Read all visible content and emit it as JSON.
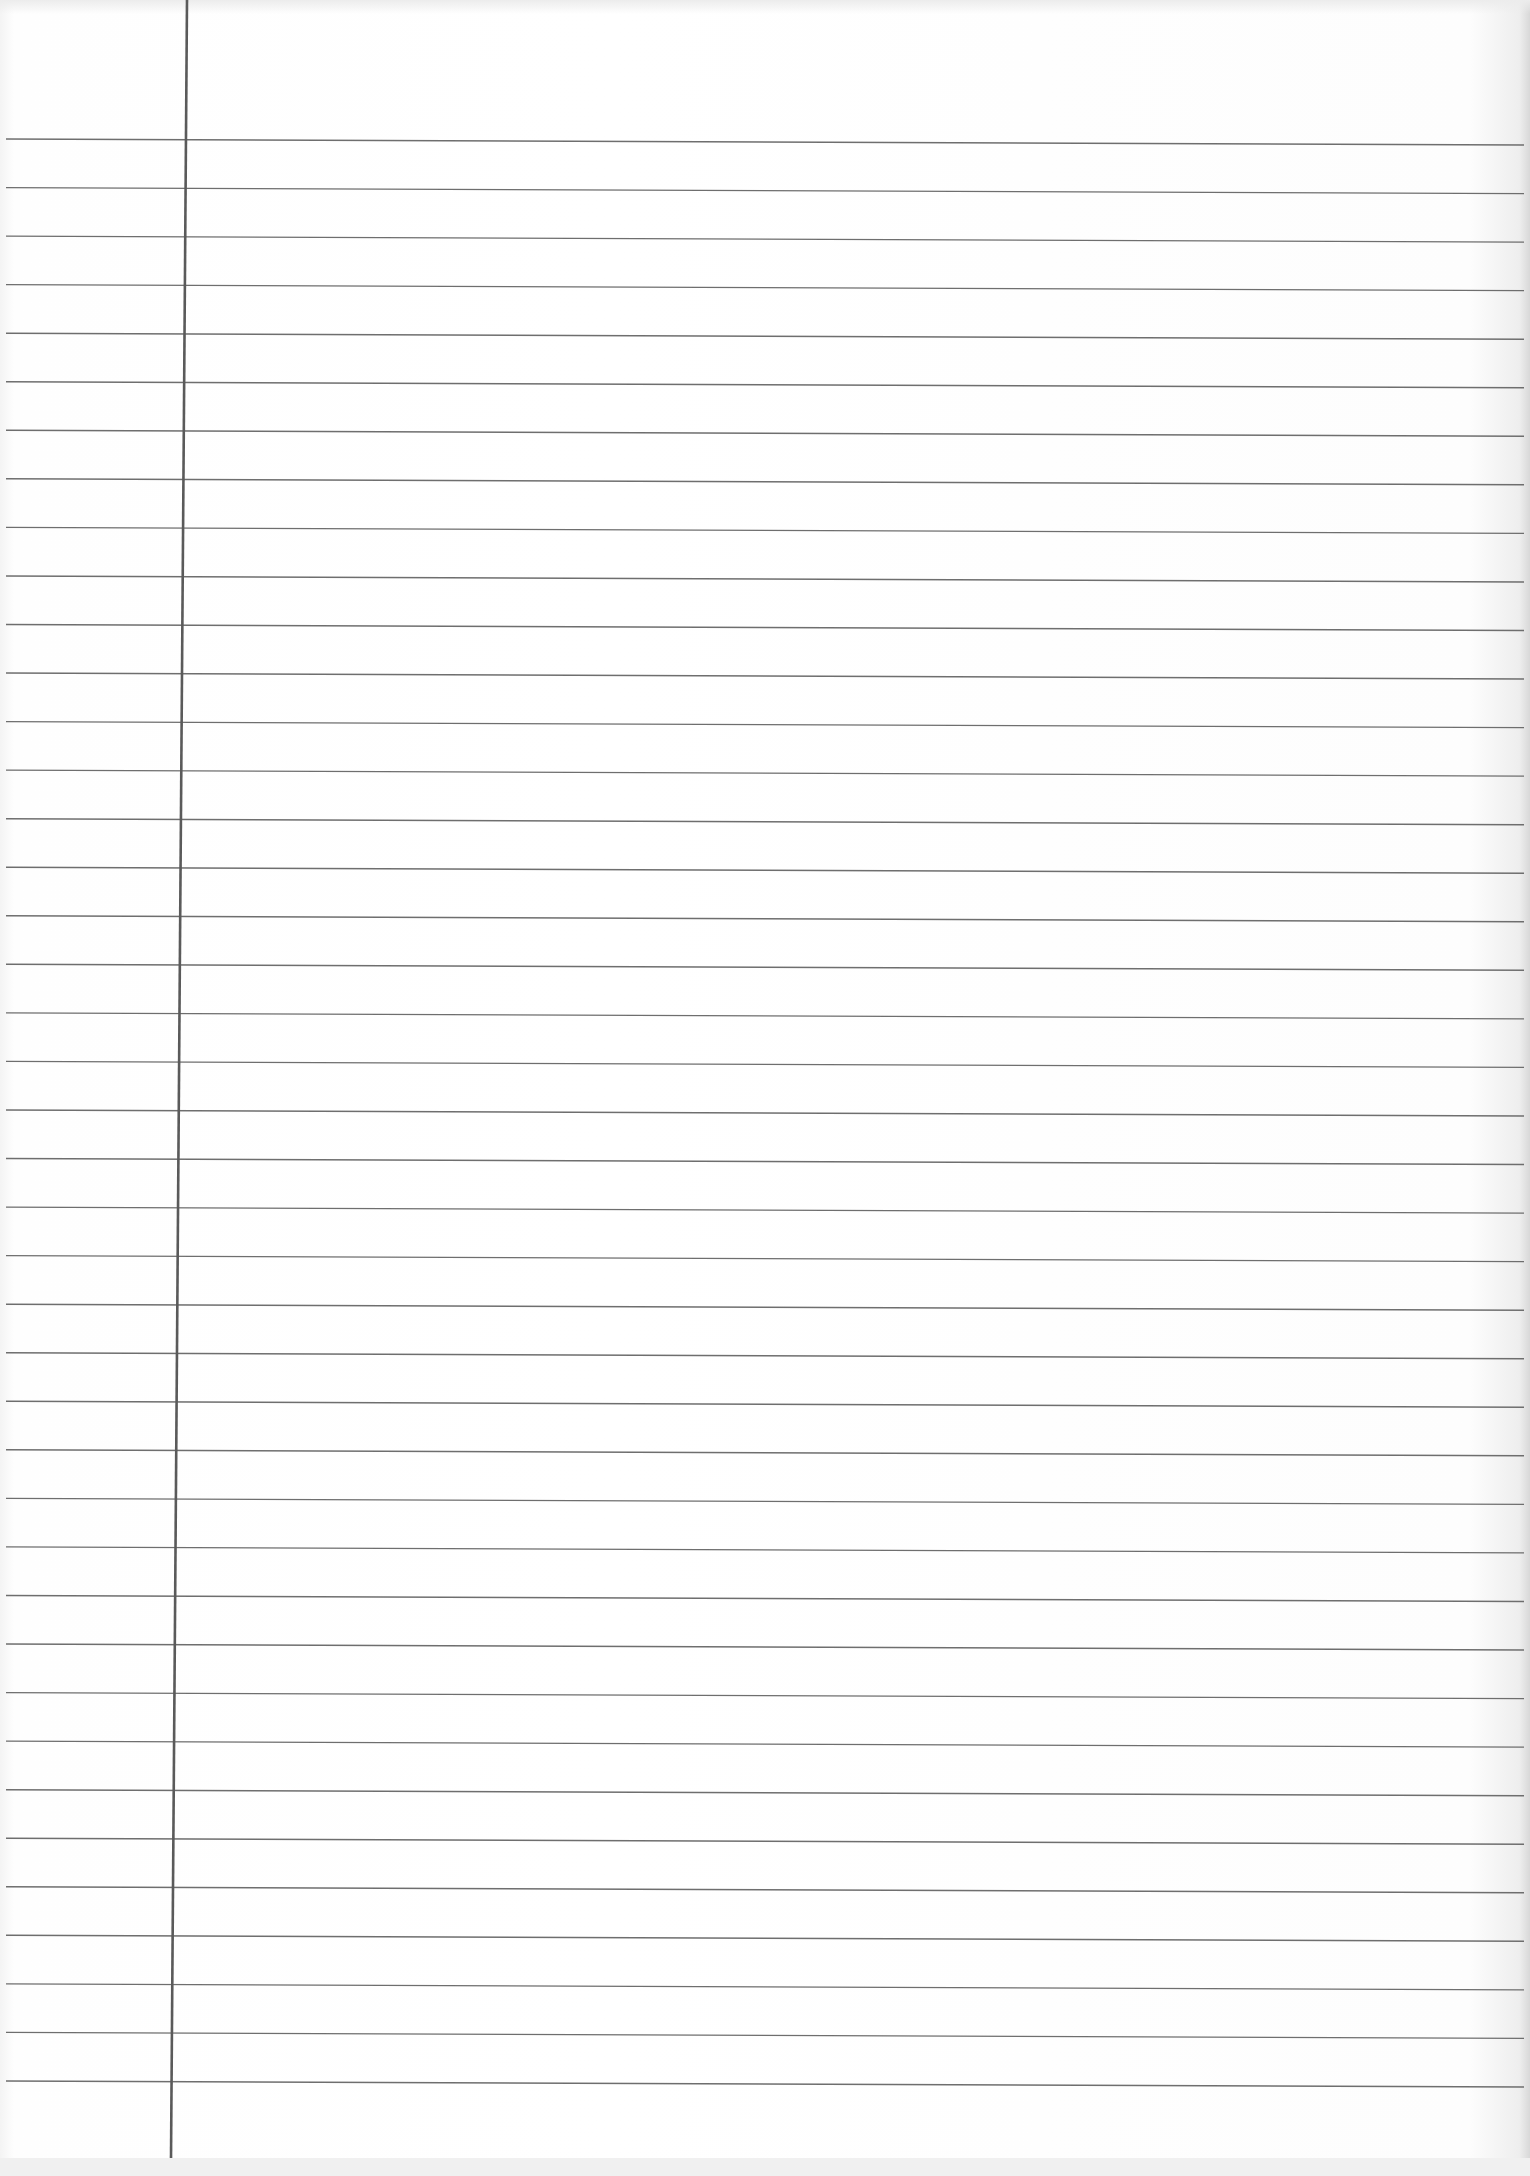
{
  "document": {
    "type": "ruled-notebook-paper",
    "content": "",
    "ruled_lines": {
      "count": 41,
      "first_y": 139,
      "spacing": 48.55,
      "slope_px": 6,
      "x_start": 6,
      "x_end": 1524,
      "color": "#6e6e6e"
    },
    "margin_line": {
      "x_top": 187,
      "x_bottom": 171,
      "y_top": 0,
      "y_bottom": 2158,
      "color": "#5a5a5a"
    },
    "paper_color": "#fdfdfd"
  }
}
